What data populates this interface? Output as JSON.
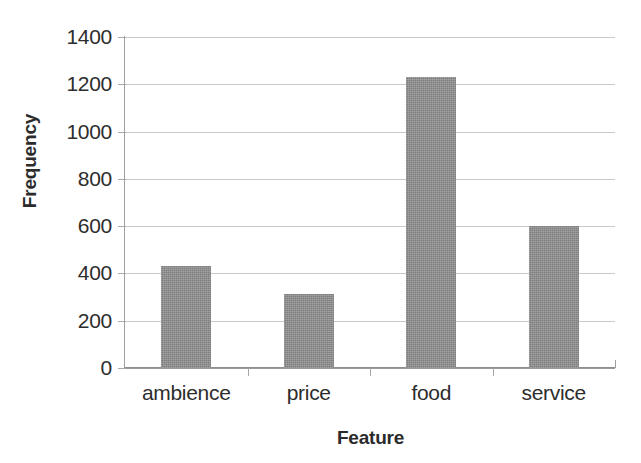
{
  "chart_data": {
    "type": "bar",
    "title": "",
    "subtitle": "",
    "xlabel": "Feature",
    "ylabel": "Frequency",
    "categories": [
      "ambience",
      "price",
      "food",
      "service"
    ],
    "values": [
      430,
      315,
      1230,
      600
    ],
    "series": [
      {
        "name": "Frequency",
        "values": [
          430,
          315,
          1230,
          600
        ]
      }
    ],
    "ylim": [
      0,
      1400
    ],
    "yticks": [
      0,
      200,
      400,
      600,
      800,
      1000,
      1200,
      1400
    ],
    "ytick_labels": [
      "0",
      "200",
      "400",
      "600",
      "800",
      "1000",
      "1200",
      "1400"
    ],
    "grid": true,
    "grid_axis": "y",
    "legend": false,
    "legend_position": "none",
    "bar_color": "#8d8d8d",
    "gridline_color": "#c9c9c9",
    "axis_color": "#9a9a9a",
    "text_color": "#2d2d2d",
    "background_color": "#ffffff",
    "annotations": []
  }
}
